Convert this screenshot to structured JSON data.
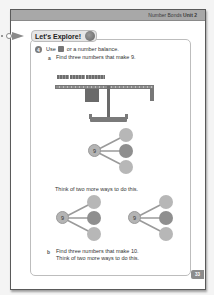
{
  "header": {
    "chapter": "Number Bonds",
    "unit": "Unit 2"
  },
  "explore": {
    "title": "Let's Explore!",
    "icon": "character-icon"
  },
  "question": {
    "number": "4",
    "text_before_icon": "Use",
    "icon": "cube-icon",
    "text_after_icon": "or a number balance."
  },
  "part_a": {
    "label": "a",
    "text": "Find three numbers that make 9.",
    "prompt": "Think of two more ways to do this.",
    "whole": "9"
  },
  "part_b": {
    "label": "b",
    "line1": "Find three numbers that make 10.",
    "line2": "Think of two more ways to do this."
  },
  "bonds": [
    {
      "whole": "9",
      "parts": [
        "",
        "",
        ""
      ]
    },
    {
      "whole": "9",
      "parts": [
        "",
        "",
        ""
      ]
    },
    {
      "whole": "9",
      "parts": [
        "",
        "",
        ""
      ]
    }
  ],
  "footer": {
    "page_number": "33"
  },
  "colors": {
    "header_bar": "#a8a8a8",
    "tab_bg": "#e6e6e6",
    "part_circle": "#b7b7b7",
    "part_circle_dark": "#8f8f8f",
    "page_num_bg": "#8c8c8c"
  }
}
